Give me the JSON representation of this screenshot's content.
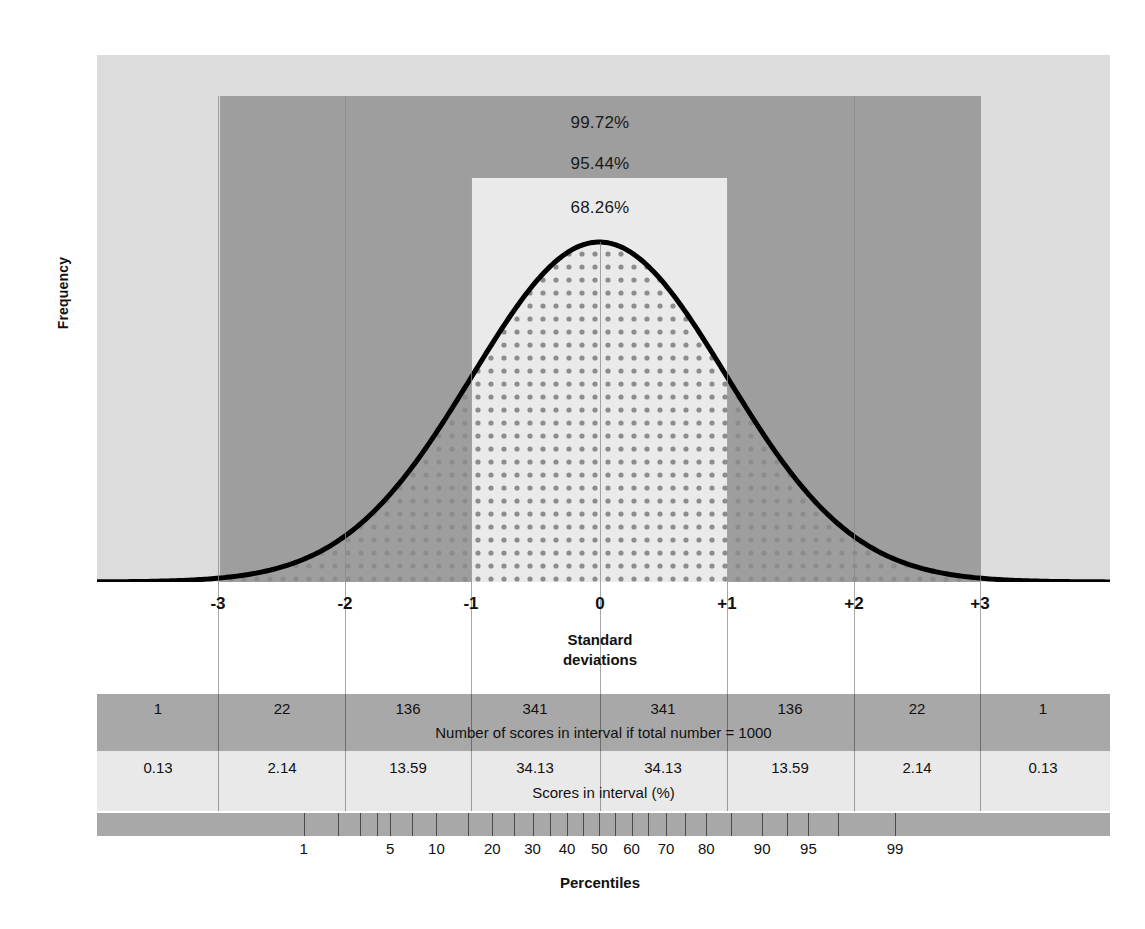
{
  "figure": {
    "y_axis_label": "Frequency",
    "x_axis_caption_line1": "Standard",
    "x_axis_caption_line2": "deviations",
    "percentiles_caption": "Percentiles",
    "counts_caption": "Number of scores in interval if total number = 1000",
    "percent_caption": "Scores in interval (%)"
  },
  "colors": {
    "band_outer": "#dcdcdc",
    "band_2sd": "#9e9e9e",
    "band_1sd": "#eaeaea",
    "row_gray": "#a8a8a8",
    "row_light": "#e9e9e9",
    "curve_line": "#000000",
    "fill_dot": "#8c8c8c"
  },
  "coverage_labels": [
    {
      "name": "three-sd",
      "text": "99.72%"
    },
    {
      "name": "two-sd",
      "text": "95.44%"
    },
    {
      "name": "one-sd",
      "text": "68.26%"
    }
  ],
  "chart_data": {
    "type": "area",
    "title": "",
    "xlabel": "Standard deviations",
    "ylabel": "Frequency",
    "xlim": [
      -4,
      4
    ],
    "ylim": [
      0,
      1
    ],
    "grid": true,
    "legend": "none",
    "distribution": "standard normal",
    "x_ticks": [
      "-3",
      "-2",
      "-1",
      "0",
      "+1",
      "+2",
      "+3"
    ],
    "x_tick_values": [
      -3,
      -2,
      -1,
      0,
      1,
      2,
      3
    ],
    "coverage_intervals": [
      {
        "sd": 1,
        "label": "68.26%",
        "value": 68.26
      },
      {
        "sd": 2,
        "label": "95.44%",
        "value": 95.44
      },
      {
        "sd": 3,
        "label": "99.72%",
        "value": 99.72
      }
    ],
    "interval_bins": [
      "<-3",
      "-3 to -2",
      "-2 to -1",
      "-1 to 0",
      "0 to +1",
      "+1 to +2",
      "+2 to +3",
      ">+3"
    ],
    "counts_per_1000": [
      "1",
      "22",
      "136",
      "341",
      "341",
      "136",
      "22",
      "1"
    ],
    "percent_per_interval": [
      "0.13",
      "2.14",
      "13.59",
      "34.13",
      "34.13",
      "13.59",
      "2.14",
      "0.13"
    ],
    "percentile_ticks": [
      "1",
      "5",
      "10",
      "20",
      "30",
      "40",
      "50",
      "60",
      "70",
      "80",
      "90",
      "95",
      "99"
    ],
    "percentile_values": [
      1,
      5,
      10,
      20,
      30,
      40,
      50,
      60,
      70,
      80,
      90,
      95,
      99
    ]
  }
}
